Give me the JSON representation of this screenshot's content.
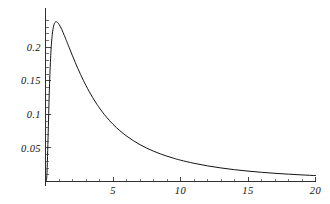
{
  "chart_data": {
    "type": "line",
    "title": "",
    "subtitle": "",
    "xlabel": "",
    "ylabel": "",
    "xlim": [
      0,
      20
    ],
    "ylim": [
      0,
      0.2525
    ],
    "grid": false,
    "legend": null,
    "x_ticks_major": [
      5,
      10,
      15,
      20
    ],
    "x_tick_labels": [
      "5",
      "10",
      "15",
      "20"
    ],
    "x_ticks_minor": [
      1,
      2,
      3,
      4,
      6,
      7,
      8,
      9,
      11,
      12,
      13,
      14,
      16,
      17,
      18,
      19
    ],
    "y_ticks_major": [
      0.05,
      0.1,
      0.15,
      0.2
    ],
    "y_tick_labels": [
      "0.05",
      "0.1",
      "0.15",
      "0.2"
    ],
    "y_ticks_minor": [
      0.01,
      0.02,
      0.03,
      0.04,
      0.06,
      0.07,
      0.08,
      0.09,
      0.11,
      0.12,
      0.13,
      0.14,
      0.16,
      0.17,
      0.18,
      0.19,
      0.21,
      0.22,
      0.23,
      0.24
    ],
    "series": [
      {
        "name": "density",
        "color": "#141414",
        "x": [
          0.0,
          0.1,
          0.2,
          0.3,
          0.4,
          0.5,
          0.6,
          0.7,
          0.8,
          0.9,
          1.0,
          1.1,
          1.2,
          1.3,
          1.4,
          1.5,
          1.6,
          1.8,
          2.0,
          2.2,
          2.4,
          2.6,
          2.8,
          3.0,
          3.25,
          3.5,
          3.75,
          4.0,
          4.5,
          5.0,
          5.5,
          6.0,
          6.5,
          7.0,
          7.5,
          8.0,
          8.5,
          9.0,
          9.5,
          10.0,
          11.0,
          12.0,
          13.0,
          14.0,
          15.0,
          16.0,
          17.0,
          18.0,
          19.0,
          20.0
        ],
        "y": [
          0.0,
          0.0085,
          0.0735,
          0.1455,
          0.1925,
          0.2185,
          0.2315,
          0.2368,
          0.238,
          0.2368,
          0.2342,
          0.2307,
          0.2266,
          0.2221,
          0.2173,
          0.2124,
          0.2074,
          0.1972,
          0.1872,
          0.1775,
          0.1682,
          0.1593,
          0.1509,
          0.1429,
          0.1335,
          0.1248,
          0.1168,
          0.1094,
          0.0963,
          0.0852,
          0.0758,
          0.0678,
          0.0609,
          0.0549,
          0.0497,
          0.0452,
          0.0412,
          0.0377,
          0.0346,
          0.0318,
          0.0271,
          0.0233,
          0.0202,
          0.0176,
          0.0155,
          0.0137,
          0.0122,
          0.0109,
          0.0098,
          0.0088
        ]
      }
    ],
    "annotations": [],
    "peak": {
      "x": 0.85,
      "y": 0.238
    }
  },
  "axes": {
    "x_axis_name": "horizontal-axis",
    "y_axis_name": "vertical-axis",
    "origin_label": ""
  },
  "style": {
    "background": "#ffffff",
    "axis_color": "#1a1a1a",
    "curve_color": "#141414",
    "label_color": "#111111"
  }
}
